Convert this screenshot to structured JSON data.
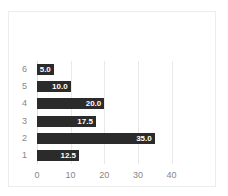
{
  "chart_data": {
    "type": "bar",
    "orientation": "horizontal",
    "title": "",
    "xlabel": "",
    "ylabel": "",
    "categories": [
      "6",
      "5",
      "4",
      "3",
      "2",
      "1"
    ],
    "values": [
      5.0,
      10.0,
      20.0,
      17.5,
      35.0,
      12.5
    ],
    "data_labels": [
      "5.0",
      "10.0",
      "20.0",
      "17.5",
      "35.0",
      "12.5"
    ],
    "xlim": [
      0,
      44
    ],
    "xticks": [
      0,
      10,
      20,
      30,
      40
    ],
    "xtick_labels": [
      "0",
      "10",
      "20",
      "30",
      "40"
    ],
    "grid": "vertical",
    "legend": "none",
    "bar_color": "#2b2b2b",
    "data_label_color": "#ffffff",
    "tick_label_color": "#868686",
    "gridline_color": "#e8e9ea",
    "background_color": "#ffffff",
    "border_color": "#eceded"
  }
}
